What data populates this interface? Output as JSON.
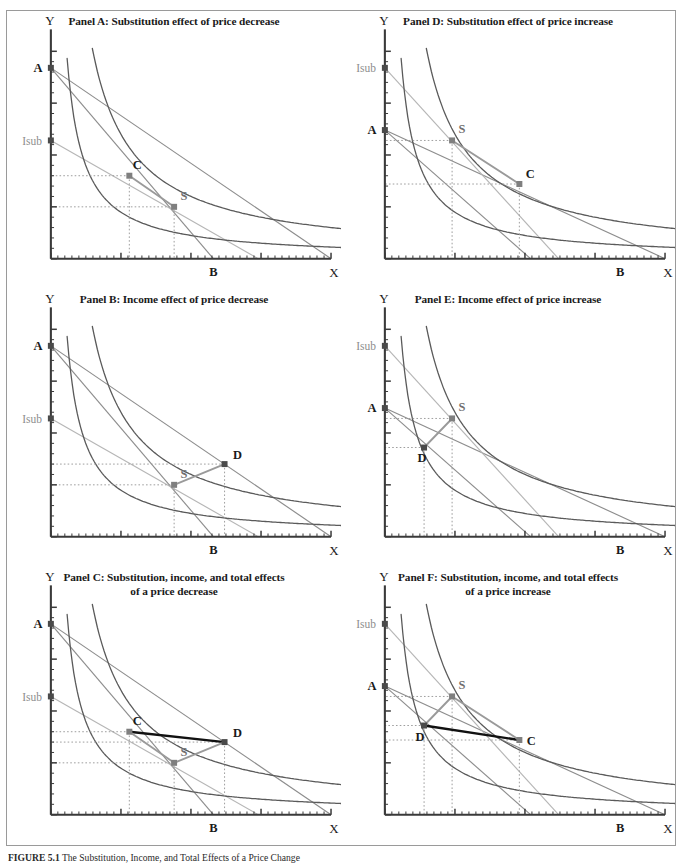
{
  "figure": {
    "caption_label": "FIGURE 5.1",
    "caption_text": "The Substitution, Income, and Total Effects of a Price Change",
    "axis_labels": {
      "x": "X",
      "y": "Y"
    },
    "point_labels": {
      "A": "A",
      "B": "B",
      "C": "C",
      "D": "D",
      "S": "S",
      "Isub": "Isub"
    },
    "colors": {
      "curve_dark": "#5a5a5a",
      "curve_black": "#1a1a1a",
      "budget_gray": "#8d8d8d",
      "budget_light": "#b6b6b6",
      "axis": "#3a3a3a",
      "marker_gray": "#7f7f7f",
      "marker_dark": "#4a4a4a",
      "dotted": "#9e9e9e",
      "total_effect": "#111111",
      "frame": "#9a9a9a",
      "isub_label": "#8d8d8d"
    }
  },
  "panels": [
    {
      "id": "A",
      "title": "Panel A: Substitution effect of price decrease",
      "subtitle": "",
      "direction": "decrease",
      "shown_points": [
        "A",
        "B",
        "C",
        "S",
        "Isub"
      ],
      "effect_highlight": "substitution",
      "description": "Original optimum C on initial budget line; compensated budget line tangent at S showing substitution effect of a price decrease."
    },
    {
      "id": "B",
      "title": "Panel B: Income effect of price decrease",
      "subtitle": "",
      "direction": "decrease",
      "shown_points": [
        "A",
        "B",
        "D",
        "S",
        "Isub"
      ],
      "effect_highlight": "income",
      "description": "Movement from compensated optimum S to final optimum D showing income effect of a price decrease."
    },
    {
      "id": "C",
      "title": "Panel C: Substitution, income, and total effects",
      "subtitle": "of a price decrease",
      "direction": "decrease",
      "shown_points": [
        "A",
        "B",
        "C",
        "D",
        "S",
        "Isub"
      ],
      "effect_highlight": "total",
      "description": "Total effect C to D decomposed into substitution C to S and income S to D for a price decrease."
    },
    {
      "id": "D",
      "title": "Panel D: Substitution effect of price increase",
      "subtitle": "",
      "direction": "increase",
      "shown_points": [
        "A",
        "B",
        "C",
        "S",
        "Isub"
      ],
      "effect_highlight": "substitution",
      "description": "Original optimum C; compensated budget line tangent at S showing substitution effect of a price increase."
    },
    {
      "id": "E",
      "title": "Panel E: Income effect of price increase",
      "subtitle": "",
      "direction": "increase",
      "shown_points": [
        "A",
        "B",
        "D",
        "S",
        "Isub"
      ],
      "effect_highlight": "income",
      "description": "Movement from compensated optimum S to final optimum D showing income effect of a price increase."
    },
    {
      "id": "F",
      "title": "Panel F: Substitution, income, and total effects",
      "subtitle": "of a price increase",
      "direction": "increase",
      "shown_points": [
        "A",
        "B",
        "C",
        "D",
        "S",
        "Isub"
      ],
      "effect_highlight": "total",
      "description": "Total effect C to D decomposed into substitution C to S and income S to D for a price increase."
    }
  ],
  "chart_data": {
    "type": "line",
    "title": "The Substitution, Income, and Total Effects of a Price Change",
    "xlabel": "X",
    "ylabel": "Y",
    "xlim": [
      0,
      100
    ],
    "ylim": [
      0,
      100
    ],
    "grid": false,
    "legend": "none",
    "panel_series": {
      "A": {
        "budget_lines": [
          {
            "name": "original-budget-AB",
            "from": [
              0,
              92
            ],
            "to": [
              58,
              0
            ],
            "color": "#8d8d8d"
          },
          {
            "name": "new-budget-A-Xmax",
            "from": [
              0,
              92
            ],
            "to": [
              100,
              0
            ],
            "color": "#8d8d8d"
          },
          {
            "name": "compensated-budget-Isub",
            "from": [
              0,
              57
            ],
            "to": [
              74,
              0
            ],
            "color": "#b6b6b6"
          }
        ],
        "indifference_curves": [
          {
            "name": "IC1-through-C",
            "k": 560,
            "color": "#5a5a5a"
          },
          {
            "name": "IC2-outer",
            "k": 1500,
            "color": "#5a5a5a"
          }
        ],
        "points": [
          {
            "label": "A",
            "x": 0,
            "y": 92
          },
          {
            "label": "C",
            "x": 28,
            "y": 40
          },
          {
            "label": "S",
            "x": 44,
            "y": 25
          },
          {
            "label": "B",
            "x": 58,
            "y": 0
          }
        ],
        "connectors": [
          {
            "from": "C",
            "to": "S",
            "color": "#9a9a9a",
            "weight": "medium"
          }
        ]
      },
      "B": {
        "budget_lines": [
          {
            "name": "original-budget-AB",
            "from": [
              0,
              92
            ],
            "to": [
              58,
              0
            ],
            "color": "#8d8d8d"
          },
          {
            "name": "new-budget-A-Xmax",
            "from": [
              0,
              92
            ],
            "to": [
              100,
              0
            ],
            "color": "#8d8d8d"
          },
          {
            "name": "compensated-budget-Isub",
            "from": [
              0,
              57
            ],
            "to": [
              74,
              0
            ],
            "color": "#b6b6b6"
          }
        ],
        "indifference_curves": [
          {
            "name": "IC1-through-C",
            "k": 560,
            "color": "#5a5a5a"
          },
          {
            "name": "IC2-outer",
            "k": 1500,
            "color": "#5a5a5a"
          }
        ],
        "points": [
          {
            "label": "A",
            "x": 0,
            "y": 92
          },
          {
            "label": "S",
            "x": 44,
            "y": 25
          },
          {
            "label": "D",
            "x": 62,
            "y": 35
          },
          {
            "label": "B",
            "x": 58,
            "y": 0
          }
        ],
        "connectors": [
          {
            "from": "S",
            "to": "D",
            "color": "#9a9a9a",
            "weight": "medium"
          }
        ]
      },
      "C": {
        "budget_lines": [
          {
            "name": "original-budget-AB",
            "from": [
              0,
              92
            ],
            "to": [
              58,
              0
            ],
            "color": "#8d8d8d"
          },
          {
            "name": "new-budget-A-Xmax",
            "from": [
              0,
              92
            ],
            "to": [
              100,
              0
            ],
            "color": "#8d8d8d"
          },
          {
            "name": "compensated-budget-Isub",
            "from": [
              0,
              57
            ],
            "to": [
              74,
              0
            ],
            "color": "#b6b6b6"
          }
        ],
        "indifference_curves": [
          {
            "name": "IC1-through-C",
            "k": 560,
            "color": "#5a5a5a"
          },
          {
            "name": "IC2-outer",
            "k": 1500,
            "color": "#5a5a5a"
          }
        ],
        "points": [
          {
            "label": "A",
            "x": 0,
            "y": 92
          },
          {
            "label": "C",
            "x": 28,
            "y": 40
          },
          {
            "label": "S",
            "x": 44,
            "y": 25
          },
          {
            "label": "D",
            "x": 62,
            "y": 35
          },
          {
            "label": "B",
            "x": 58,
            "y": 0
          }
        ],
        "connectors": [
          {
            "from": "C",
            "to": "D",
            "color": "#111111",
            "weight": "thick",
            "meaning": "total-effect"
          },
          {
            "from": "C",
            "to": "S",
            "color": "#9a9a9a",
            "weight": "medium",
            "meaning": "substitution-effect"
          },
          {
            "from": "S",
            "to": "D",
            "color": "#9a9a9a",
            "weight": "medium",
            "meaning": "income-effect"
          }
        ]
      },
      "D": {
        "budget_lines": [
          {
            "name": "original-budget-A-Xmax",
            "from": [
              0,
              62
            ],
            "to": [
              100,
              0
            ],
            "color": "#8d8d8d"
          },
          {
            "name": "new-budget-AB",
            "from": [
              0,
              62
            ],
            "to": [
              52,
              0
            ],
            "color": "#8d8d8d"
          },
          {
            "name": "compensated-budget-Isub",
            "from": [
              0,
              92
            ],
            "to": [
              62,
              0
            ],
            "color": "#b6b6b6"
          }
        ],
        "indifference_curves": [
          {
            "name": "IC1-inner",
            "k": 560,
            "color": "#5a5a5a"
          },
          {
            "name": "IC2-through-C",
            "k": 1500,
            "color": "#5a5a5a"
          }
        ],
        "points": [
          {
            "label": "A",
            "x": 0,
            "y": 62
          },
          {
            "label": "S",
            "x": 24,
            "y": 57
          },
          {
            "label": "C",
            "x": 48,
            "y": 36
          },
          {
            "label": "B",
            "x": 84,
            "y": 0
          }
        ],
        "connectors": [
          {
            "from": "S",
            "to": "C",
            "color": "#9a9a9a",
            "weight": "medium"
          }
        ]
      },
      "E": {
        "budget_lines": [
          {
            "name": "original-budget-A-Xmax",
            "from": [
              0,
              62
            ],
            "to": [
              100,
              0
            ],
            "color": "#8d8d8d"
          },
          {
            "name": "new-budget-AB",
            "from": [
              0,
              62
            ],
            "to": [
              52,
              0
            ],
            "color": "#8d8d8d"
          },
          {
            "name": "compensated-budget-Isub",
            "from": [
              0,
              92
            ],
            "to": [
              62,
              0
            ],
            "color": "#b6b6b6"
          }
        ],
        "indifference_curves": [
          {
            "name": "IC1-inner",
            "k": 560,
            "color": "#5a5a5a"
          },
          {
            "name": "IC2-through-C",
            "k": 1500,
            "color": "#5a5a5a"
          }
        ],
        "points": [
          {
            "label": "A",
            "x": 0,
            "y": 62
          },
          {
            "label": "S",
            "x": 24,
            "y": 57
          },
          {
            "label": "D",
            "x": 14,
            "y": 43
          },
          {
            "label": "B",
            "x": 84,
            "y": 0
          }
        ],
        "connectors": [
          {
            "from": "S",
            "to": "D",
            "color": "#9a9a9a",
            "weight": "medium"
          }
        ]
      },
      "F": {
        "budget_lines": [
          {
            "name": "original-budget-A-Xmax",
            "from": [
              0,
              62
            ],
            "to": [
              100,
              0
            ],
            "color": "#8d8d8d"
          },
          {
            "name": "new-budget-AB",
            "from": [
              0,
              62
            ],
            "to": [
              52,
              0
            ],
            "color": "#8d8d8d"
          },
          {
            "name": "compensated-budget-Isub",
            "from": [
              0,
              92
            ],
            "to": [
              62,
              0
            ],
            "color": "#b6b6b6"
          }
        ],
        "indifference_curves": [
          {
            "name": "IC1-inner",
            "k": 560,
            "color": "#5a5a5a"
          },
          {
            "name": "IC2-through-C",
            "k": 1500,
            "color": "#5a5a5a"
          }
        ],
        "points": [
          {
            "label": "A",
            "x": 0,
            "y": 62
          },
          {
            "label": "S",
            "x": 24,
            "y": 57
          },
          {
            "label": "D",
            "x": 14,
            "y": 43
          },
          {
            "label": "C",
            "x": 48,
            "y": 36
          },
          {
            "label": "B",
            "x": 84,
            "y": 0
          }
        ],
        "connectors": [
          {
            "from": "D",
            "to": "C",
            "color": "#111111",
            "weight": "thick",
            "meaning": "total-effect"
          },
          {
            "from": "S",
            "to": "C",
            "color": "#9a9a9a",
            "weight": "medium",
            "meaning": "substitution-effect"
          },
          {
            "from": "S",
            "to": "D",
            "color": "#9a9a9a",
            "weight": "medium",
            "meaning": "income-effect"
          }
        ]
      }
    }
  }
}
